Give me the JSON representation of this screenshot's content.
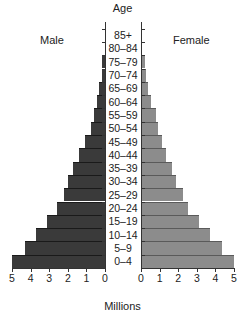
{
  "chart_data": {
    "type": "bar",
    "title": "Age",
    "xlabel": "Millions",
    "ylabel": "Age",
    "orientation": "horizontal-population-pyramid",
    "categories": [
      "0–4",
      "5–9",
      "10–14",
      "15–19",
      "20–24",
      "25–29",
      "30–34",
      "35–39",
      "40–44",
      "45–49",
      "50–54",
      "55–59",
      "60–64",
      "65–69",
      "70–74",
      "75–79",
      "80–84",
      "85+"
    ],
    "series": [
      {
        "name": "Male",
        "color": "#3a3a3a",
        "values": [
          5.0,
          4.3,
          3.7,
          3.1,
          2.6,
          2.2,
          2.0,
          1.7,
          1.4,
          1.1,
          0.75,
          0.6,
          0.45,
          0.3,
          0.15,
          0.15,
          0.0,
          0.0
        ]
      },
      {
        "name": "Female",
        "color": "#8c8c8c",
        "values": [
          5.0,
          4.35,
          3.7,
          3.1,
          2.55,
          2.25,
          1.9,
          1.65,
          1.35,
          1.15,
          0.9,
          0.8,
          0.55,
          0.4,
          0.25,
          0.2,
          0.0,
          0.0
        ]
      }
    ],
    "xlim": [
      0,
      5
    ],
    "male_ticks": [
      "5",
      "4",
      "3",
      "2",
      "1",
      "0"
    ],
    "female_ticks": [
      "0",
      "1",
      "2",
      "3",
      "4",
      "5"
    ],
    "legend": [
      "Male",
      "Female"
    ],
    "grid": false
  },
  "labels": {
    "title": "Age",
    "male": "Male",
    "female": "Female",
    "xlabel": "Millions"
  }
}
